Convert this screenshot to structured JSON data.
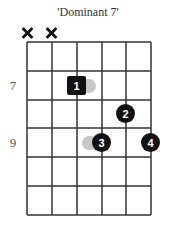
{
  "title": "'Dominant 7'",
  "diagram": {
    "strings": 6,
    "frets_shown": 6,
    "muted_strings": [
      1,
      2
    ],
    "fret_labels": [
      {
        "fret_row": 2,
        "label": "7"
      },
      {
        "fret_row": 4,
        "label": "9"
      }
    ],
    "fingers": [
      {
        "label": "1",
        "string": 3,
        "fret": 7,
        "shape": "square"
      },
      {
        "label": "2",
        "string": 5,
        "fret": 8,
        "shape": "circle"
      },
      {
        "label": "3",
        "string": 4,
        "fret": 9,
        "shape": "circle"
      },
      {
        "label": "4",
        "string": 6,
        "fret": 9,
        "shape": "circle"
      }
    ],
    "colors": {
      "grid": "#333333",
      "finger": "#111111",
      "ghost": "#c8c8c8",
      "muted": "#111111"
    }
  }
}
